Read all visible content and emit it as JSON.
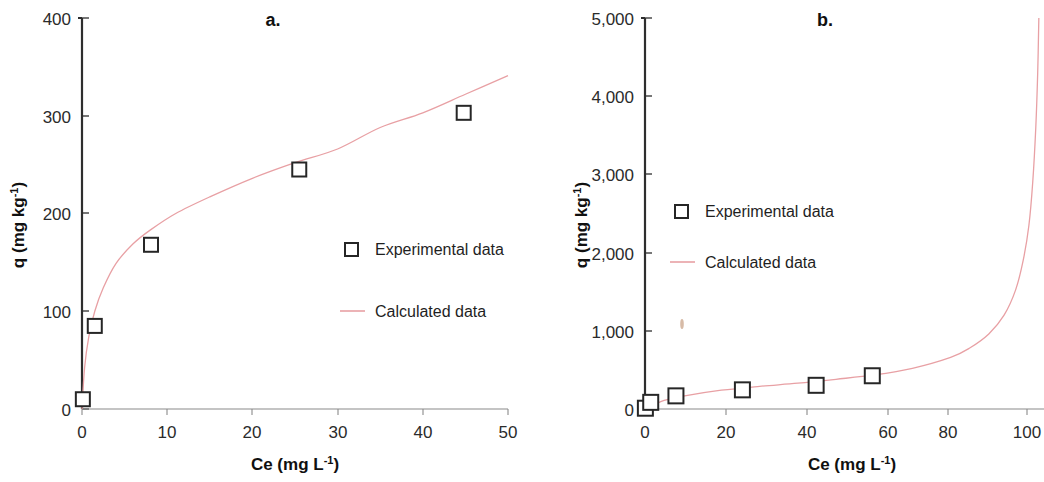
{
  "figure": {
    "background_color": "#ffffff",
    "panels": [
      {
        "id": "a",
        "letter": "a.",
        "xlabel_main": "Ce (mg L",
        "xlabel_sup": "-1",
        "xlabel_close": ")",
        "ylabel_main": "q (mg kg",
        "ylabel_sup": "-1",
        "ylabel_close": ")",
        "x_ticks": [
          "0",
          "10",
          "20",
          "30",
          "40",
          "50"
        ],
        "y_ticks": [
          "0",
          "100",
          "200",
          "300",
          "400"
        ],
        "legend": [
          {
            "label": "Experimental data",
            "marker": "open-square",
            "color": "#262626"
          },
          {
            "label": "Calculated data",
            "marker": "line",
            "color": "#e8a0a4"
          }
        ]
      },
      {
        "id": "b",
        "letter": "b.",
        "xlabel_main": "Ce (mg L",
        "xlabel_sup": "-1",
        "xlabel_close": ")",
        "ylabel_main": "q (mg kg",
        "ylabel_sup": "-1",
        "ylabel_close": ")",
        "x_ticks": [
          "0",
          "20",
          "40",
          "60",
          "80",
          "100"
        ],
        "y_ticks": [
          "0",
          "1,000",
          "2,000",
          "3,000",
          "4,000",
          "5,000"
        ],
        "legend": [
          {
            "label": "Experimental data",
            "marker": "open-square",
            "color": "#262626"
          },
          {
            "label": "Calculated data",
            "marker": "line",
            "color": "#e8a0a4"
          }
        ]
      }
    ]
  },
  "chart_data": [
    {
      "type": "scatter",
      "title": "a.",
      "xlabel": "Ce (mg L-1)",
      "ylabel": "q (mg kg-1)",
      "xlim": [
        0,
        50
      ],
      "ylim": [
        0,
        400
      ],
      "xticks": [
        0,
        10,
        20,
        30,
        40,
        50
      ],
      "yticks": [
        0,
        100,
        200,
        300,
        400
      ],
      "grid": false,
      "legend_position": "center-right",
      "series": [
        {
          "name": "Experimental data",
          "marker": "open-square",
          "color": "#262626",
          "x": [
            0.1,
            1.5,
            8.1,
            25.5,
            44.8
          ],
          "y": [
            10,
            85,
            168,
            245,
            303
          ]
        },
        {
          "name": "Calculated data",
          "marker": "line",
          "color": "#e8a0a4",
          "model": "freundlich",
          "x": [
            0.0,
            0.3,
            0.8,
            1.5,
            2.5,
            4.0,
            6.0,
            8.0,
            11.0,
            15.0,
            20.0,
            25.0,
            30.0,
            35.0,
            40.0,
            45.0,
            50.0
          ],
          "y": [
            0,
            42,
            74,
            100,
            124,
            149,
            169,
            183,
            200,
            217,
            236,
            252,
            266,
            288,
            303,
            322,
            341
          ]
        }
      ]
    },
    {
      "type": "scatter",
      "title": "b.",
      "xlabel": "Ce (mg L-1)",
      "ylabel": "q (mg kg-1)",
      "xlim": [
        0,
        105
      ],
      "ylim": [
        0,
        5000
      ],
      "xticks": [
        0,
        20,
        40,
        60,
        80,
        100
      ],
      "yticks": [
        0,
        1000,
        2000,
        3000,
        4000,
        5000
      ],
      "grid": false,
      "legend_position": "center-left",
      "series": [
        {
          "name": "Experimental data",
          "marker": "open-square",
          "color": "#262626",
          "x": [
            0.1,
            1.5,
            8.1,
            25.5,
            44.8,
            59.5
          ],
          "y": [
            10,
            85,
            168,
            245,
            303,
            425
          ]
        },
        {
          "name": "Calculated data",
          "marker": "line",
          "color": "#e8a0a4",
          "model": "bet",
          "x": [
            0.0,
            5.0,
            10.0,
            20.0,
            30.0,
            40.0,
            50.0,
            60.0,
            70.0,
            80.0,
            85.0,
            90.0,
            94.0,
            97.0,
            99.0,
            100.5,
            101.5,
            102.3,
            102.8,
            103.1
          ],
          "y": [
            0,
            110,
            165,
            240,
            290,
            330,
            380,
            435,
            520,
            660,
            780,
            960,
            1200,
            1520,
            1900,
            2350,
            2900,
            3600,
            4300,
            5000
          ]
        }
      ],
      "annotations": [
        {
          "name": "scan-speck",
          "x": 9.0,
          "y": 1080
        }
      ]
    }
  ]
}
